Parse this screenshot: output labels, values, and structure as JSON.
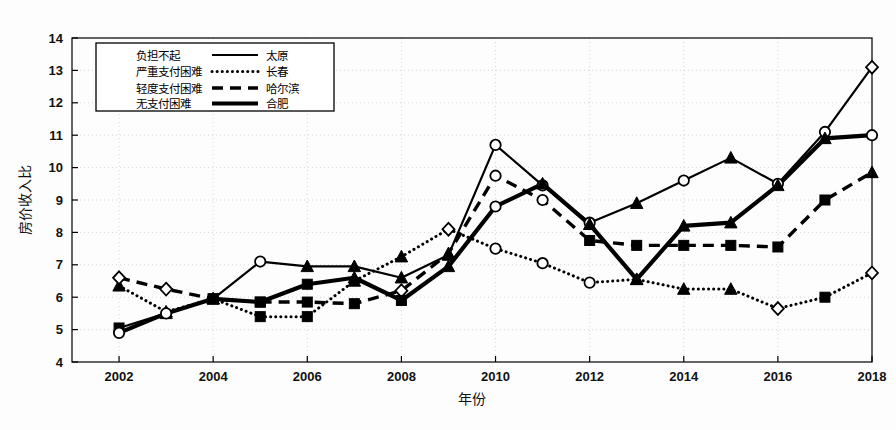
{
  "chart_data": {
    "type": "line",
    "title": "",
    "xlabel": "年份",
    "ylabel": "房价收入比",
    "xlim": [
      2001,
      2018
    ],
    "ylim": [
      4,
      14
    ],
    "xticks": [
      "2002",
      "2004",
      "2006",
      "2008",
      "2010",
      "2012",
      "2014",
      "2016",
      "2018"
    ],
    "yticks": [
      "4",
      "5",
      "6",
      "7",
      "8",
      "9",
      "10",
      "11",
      "12",
      "13",
      "14"
    ],
    "grid": true,
    "legend_position": "upper-left",
    "legend_marker_entries": [
      {
        "marker": "circle-open",
        "label": "负担不起"
      },
      {
        "marker": "square-filled",
        "label": "严重支付困难"
      },
      {
        "marker": "diamond-open",
        "label": "轻度支付困难"
      },
      {
        "marker": "triangle-filled",
        "label": "无支付困难"
      }
    ],
    "legend_line_entries": [
      {
        "style": "solid-thin",
        "label": "太原"
      },
      {
        "style": "dotted",
        "label": "长春"
      },
      {
        "style": "dashed",
        "label": "哈尔滨"
      },
      {
        "style": "solid-thick",
        "label": "合肥"
      }
    ],
    "x": [
      2002,
      2003,
      2004,
      2005,
      2006,
      2007,
      2008,
      2009,
      2010,
      2011,
      2012,
      2013,
      2014,
      2015,
      2016,
      2017,
      2018
    ],
    "series": [
      {
        "name": "太原",
        "style": "solid-thin",
        "values": [
          5.05,
          5.5,
          5.95,
          7.1,
          6.95,
          6.95,
          6.6,
          7.3,
          10.7,
          9.45,
          8.3,
          8.9,
          9.6,
          10.3,
          9.5,
          11.1,
          13.1
        ]
      },
      {
        "name": "长春",
        "style": "dotted",
        "values": [
          6.35,
          5.55,
          5.95,
          5.4,
          5.4,
          6.5,
          7.25,
          8.1,
          7.5,
          7.05,
          6.45,
          6.55,
          6.25,
          6.25,
          5.65,
          6.0,
          6.75
        ]
      },
      {
        "name": "哈尔滨",
        "style": "dashed",
        "values": [
          6.6,
          6.25,
          5.95,
          5.85,
          5.85,
          5.8,
          6.2,
          7.35,
          9.75,
          9.0,
          7.75,
          7.6,
          7.6,
          7.6,
          7.55,
          9.0,
          9.85
        ]
      },
      {
        "name": "合肥",
        "style": "solid-thick",
        "values": [
          4.9,
          5.5,
          5.95,
          5.85,
          6.4,
          6.6,
          5.9,
          6.95,
          8.8,
          9.5,
          8.25,
          6.55,
          8.2,
          8.3,
          9.45,
          10.9,
          11.0
        ]
      }
    ],
    "markers_by_year": {
      "2002": [
        {
          "series": "合肥",
          "marker": "circle-open",
          "value": 4.9
        },
        {
          "series": "太原",
          "marker": "square-filled",
          "value": 5.05
        },
        {
          "series": "哈尔滨",
          "marker": "diamond-open",
          "value": 6.6
        },
        {
          "series": "长春",
          "marker": "triangle-filled",
          "value": 6.35
        }
      ],
      "2010": [
        {
          "series": "太原",
          "marker": "circle-open",
          "value": 10.7
        },
        {
          "series": "哈尔滨",
          "marker": "circle-open",
          "value": 9.75
        },
        {
          "series": "合肥",
          "marker": "circle-open",
          "value": 8.8
        },
        {
          "series": "长春",
          "marker": "circle-open",
          "value": 7.5
        }
      ],
      "2018": [
        {
          "series": "太原",
          "marker": "diamond-open",
          "value": 13.1
        },
        {
          "series": "合肥",
          "marker": "circle-open",
          "value": 11.0
        },
        {
          "series": "哈尔滨",
          "marker": "triangle-filled",
          "value": 9.85
        },
        {
          "series": "长春",
          "marker": "diamond-open",
          "value": 6.75
        }
      ]
    },
    "colors": {
      "line": "#000000",
      "axis": "#000000",
      "grid": "#cccccc",
      "background": "#ffffff"
    }
  }
}
